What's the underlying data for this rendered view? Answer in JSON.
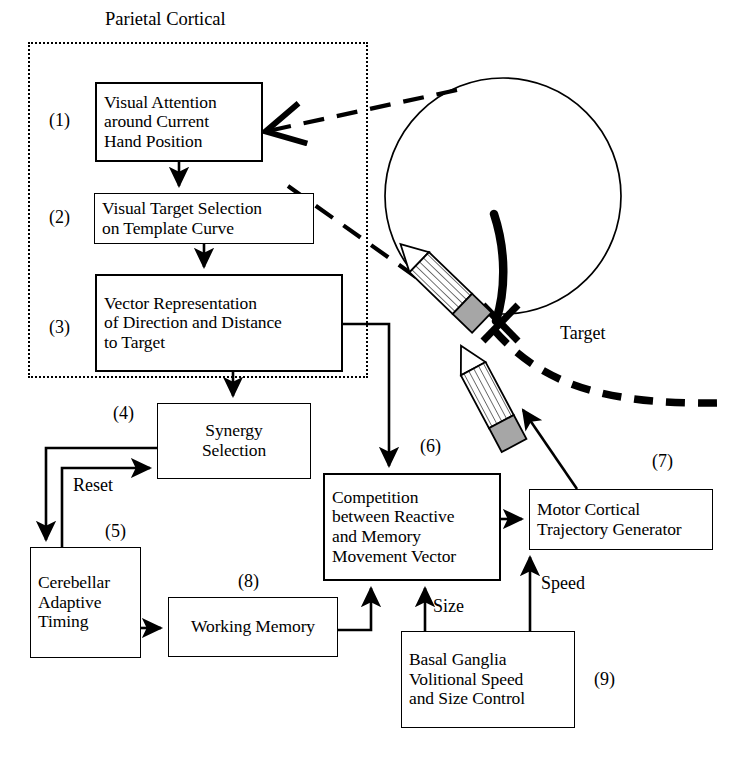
{
  "diagram": {
    "region": {
      "title": "Parietal Cortical"
    },
    "boxes": [
      {
        "id": "visual-attention",
        "tag": "(1)",
        "label": "Visual Attention\naround Current\nHand Position"
      },
      {
        "id": "visual-target",
        "tag": "(2)",
        "label": "Visual Target Selection\non Template Curve"
      },
      {
        "id": "vector-representation",
        "tag": "(3)",
        "label": "Vector Representation\nof Direction and Distance\nto Target"
      },
      {
        "id": "synergy-selection",
        "tag": "(4)",
        "label": "Synergy\nSelection"
      },
      {
        "id": "cerebellar-timing",
        "tag": "(5)",
        "label": "Cerebellar\nAdaptive\nTiming"
      },
      {
        "id": "competition",
        "tag": "(6)",
        "label": "Competition\nbetween Reactive\nand Memory\nMovement Vector"
      },
      {
        "id": "motor-cortical",
        "tag": "(7)",
        "label": "Motor Cortical\nTrajectory Generator"
      },
      {
        "id": "working-memory",
        "tag": "(8)",
        "label": "Working Memory"
      },
      {
        "id": "basal-ganglia",
        "tag": "(9)",
        "label": "Basal Ganglia\nVolitional Speed\nand Size Control"
      }
    ],
    "edge_labels": {
      "reset": "Reset",
      "size": "Size",
      "speed": "Speed"
    },
    "illustration": {
      "target_label": "Target"
    },
    "colors": {
      "stroke": "#000000",
      "background": "#ffffff",
      "eraser_gray": "#a6a6a6"
    }
  }
}
